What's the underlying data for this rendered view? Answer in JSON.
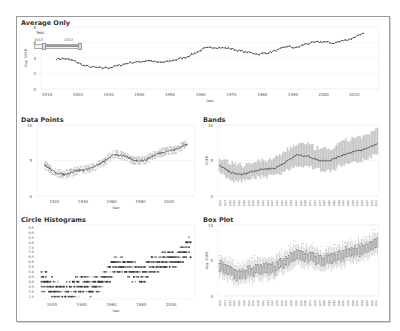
{
  "colors": {
    "line": "#555555",
    "band": "#c8c8c8",
    "grid": "#eeeeee",
    "axis": "#999999",
    "frame": "#9a9a9a"
  },
  "slider": {
    "label": "Year",
    "min_label": "1913",
    "max_label": "2013"
  },
  "panels": {
    "average_only": {
      "title": "Average Only",
      "ylabel": "Avg. SOFR",
      "xlabel": "Year"
    },
    "data_points": {
      "title": "Data Points",
      "xlabel": "Year"
    },
    "bands": {
      "title": "Bands",
      "ylabel": "SOFR"
    },
    "circle_histograms": {
      "title": "Circle Histograms",
      "xlabel": "Year"
    },
    "box_plot": {
      "title": "Box Plot",
      "ylabel": "Avg. SOFR"
    }
  },
  "chart_data": [
    {
      "type": "line",
      "title": "Average Only",
      "xlabel": "Year",
      "ylabel": "Avg. SOFR",
      "xticks": [
        1910,
        1920,
        1930,
        1940,
        1950,
        1960,
        1970,
        1980,
        1990,
        2000,
        2010
      ],
      "yticks": [
        0,
        2,
        4,
        6,
        8
      ],
      "ylim": [
        0,
        8
      ],
      "x": [
        1913,
        1916,
        1919,
        1922,
        1925,
        1928,
        1931,
        1934,
        1937,
        1940,
        1943,
        1946,
        1949,
        1952,
        1955,
        1958,
        1961,
        1964,
        1967,
        1970,
        1973,
        1976,
        1979,
        1982,
        1985,
        1988,
        1991,
        1994,
        1997,
        2000,
        2003,
        2006,
        2009,
        2012,
        2013
      ],
      "values": [
        3.9,
        3.9,
        3.6,
        3.0,
        2.8,
        2.7,
        2.8,
        3.1,
        3.4,
        3.5,
        3.7,
        3.4,
        3.5,
        3.8,
        4.1,
        4.6,
        5.2,
        5.4,
        5.3,
        5.2,
        4.9,
        4.7,
        4.5,
        4.7,
        5.0,
        5.5,
        5.3,
        5.8,
        6.0,
        6.1,
        5.9,
        6.2,
        6.5,
        7.1,
        7.1
      ],
      "grid": true
    },
    {
      "type": "scatter",
      "title": "Data Points",
      "xlabel": "Year",
      "xticks": [
        1920,
        1940,
        1960,
        1980,
        2000
      ],
      "yticks": [
        0,
        5,
        10
      ],
      "ylim": [
        0,
        10
      ],
      "x": [
        1913,
        1920,
        1927,
        1934,
        1941,
        1948,
        1955,
        1962,
        1969,
        1976,
        1983,
        1990,
        1997,
        2004,
        2011
      ],
      "values": [
        4.4,
        3.4,
        3.0,
        3.5,
        3.7,
        4.1,
        4.9,
        5.9,
        5.6,
        5.0,
        5.0,
        5.8,
        6.3,
        6.5,
        7.2
      ]
    },
    {
      "type": "area",
      "title": "Bands",
      "ylabel": "SOFR",
      "yticks": [
        0,
        5,
        10
      ],
      "ylim": [
        0,
        10
      ],
      "x": [
        1913,
        1920,
        1927,
        1934,
        1941,
        1948,
        1955,
        1962,
        1969,
        1976,
        1983,
        1990,
        1997,
        2004,
        2011,
        2013
      ],
      "series": [
        {
          "name": "mean",
          "values": [
            4.3,
            3.3,
            3.0,
            3.5,
            3.8,
            3.9,
            4.8,
            5.8,
            5.6,
            5.0,
            5.0,
            5.7,
            6.2,
            6.5,
            7.2,
            7.4
          ]
        },
        {
          "name": "low",
          "values": [
            3.5,
            2.5,
            2.3,
            2.8,
            3.0,
            3.1,
            3.8,
            4.6,
            4.5,
            4.0,
            3.8,
            4.6,
            5.0,
            5.4,
            6.0,
            6.2
          ]
        },
        {
          "name": "high",
          "values": [
            5.1,
            4.2,
            3.9,
            4.4,
            4.6,
            4.8,
            6.0,
            7.0,
            6.8,
            6.2,
            6.2,
            7.0,
            7.8,
            8.0,
            8.5,
            9.3
          ]
        }
      ]
    },
    {
      "type": "heatmap",
      "title": "Circle Histograms",
      "xlabel": "Year",
      "xticks": [
        1920,
        1940,
        1960,
        1980,
        2000
      ],
      "yticks": [
        2.5,
        3.0,
        3.5,
        4.0,
        4.5,
        5.0,
        5.5,
        6.0,
        6.5,
        7.0,
        7.5,
        8.0,
        8.5,
        9.0,
        9.5
      ]
    },
    {
      "type": "bar",
      "title": "Box Plot",
      "ylabel": "Avg. SOFR",
      "yticks": [
        0,
        5,
        10
      ],
      "ylim": [
        0,
        10
      ]
    }
  ]
}
